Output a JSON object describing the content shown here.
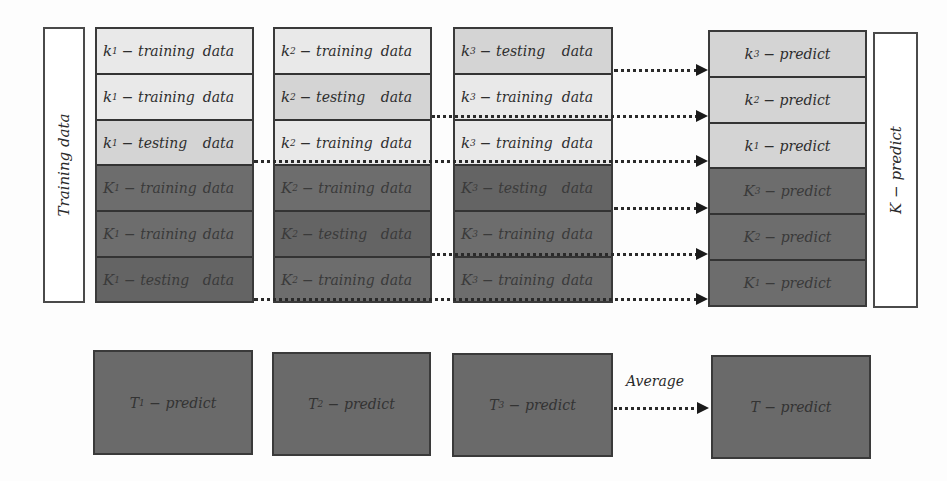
{
  "left_label": "Training data",
  "right_label": "K − predict",
  "columns": [
    {
      "rows": [
        {
          "sym": "k",
          "sub": "1",
          "word": "− training",
          "data": "data",
          "shade": "light"
        },
        {
          "sym": "k",
          "sub": "1",
          "word": "− training",
          "data": "data",
          "shade": "light"
        },
        {
          "sym": "k",
          "sub": "1",
          "word": "− testing",
          "data": "data",
          "shade": "mid"
        },
        {
          "sym": "K",
          "sub": "1",
          "word": "− training",
          "data": "data",
          "shade": "dark"
        },
        {
          "sym": "K",
          "sub": "1",
          "word": "− training",
          "data": "data",
          "shade": "dark"
        },
        {
          "sym": "K",
          "sub": "1",
          "word": "− testing",
          "data": "data",
          "shade": "darker"
        }
      ]
    },
    {
      "rows": [
        {
          "sym": "k",
          "sub": "2",
          "word": "− training",
          "data": "data",
          "shade": "light"
        },
        {
          "sym": "k",
          "sub": "2",
          "word": "− testing",
          "data": "data",
          "shade": "mid"
        },
        {
          "sym": "k",
          "sub": "2",
          "word": "− training",
          "data": "data",
          "shade": "light"
        },
        {
          "sym": "K",
          "sub": "2",
          "word": "− training",
          "data": "data",
          "shade": "dark"
        },
        {
          "sym": "K",
          "sub": "2",
          "word": "− testing",
          "data": "data",
          "shade": "darker"
        },
        {
          "sym": "K",
          "sub": "2",
          "word": "− training",
          "data": "data",
          "shade": "dark"
        }
      ]
    },
    {
      "rows": [
        {
          "sym": "k",
          "sub": "3",
          "word": "− testing",
          "data": "data",
          "shade": "mid"
        },
        {
          "sym": "k",
          "sub": "3",
          "word": "− training",
          "data": "data",
          "shade": "light"
        },
        {
          "sym": "k",
          "sub": "3",
          "word": "− training",
          "data": "data",
          "shade": "light"
        },
        {
          "sym": "K",
          "sub": "3",
          "word": "− testing",
          "data": "data",
          "shade": "darker"
        },
        {
          "sym": "K",
          "sub": "3",
          "word": "− training",
          "data": "data",
          "shade": "dark"
        },
        {
          "sym": "K",
          "sub": "3",
          "word": "− training",
          "data": "data",
          "shade": "dark"
        }
      ]
    }
  ],
  "predict_column": [
    {
      "sym": "k",
      "sub": "3",
      "word": "− predict",
      "shade": "mid"
    },
    {
      "sym": "k",
      "sub": "2",
      "word": "− predict",
      "shade": "mid"
    },
    {
      "sym": "k",
      "sub": "1",
      "word": "− predict",
      "shade": "mid"
    },
    {
      "sym": "K",
      "sub": "3",
      "word": "− predict",
      "shade": "dark"
    },
    {
      "sym": "K",
      "sub": "2",
      "word": "− predict",
      "shade": "dark"
    },
    {
      "sym": "K",
      "sub": "1",
      "word": "− predict",
      "shade": "dark"
    }
  ],
  "bottom": {
    "t1": {
      "sym": "T",
      "sub": "1",
      "word": "− predict"
    },
    "t2": {
      "sym": "T",
      "sub": "2",
      "word": "− predict"
    },
    "t3": {
      "sym": "T",
      "sub": "3",
      "word": "− predict"
    },
    "t": {
      "sym": "T",
      "sub": "",
      "word": "− predict"
    },
    "average_label": "Average"
  }
}
